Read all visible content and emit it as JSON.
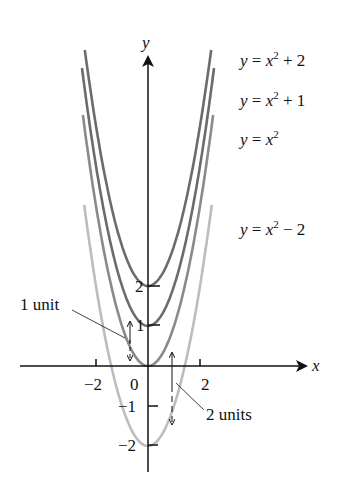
{
  "chart_data": {
    "type": "line",
    "title": "",
    "xlabel": "x",
    "ylabel": "y",
    "x_ticks": [
      "−2",
      "0",
      "2"
    ],
    "y_ticks": [
      "2",
      "1",
      "−1",
      "−2"
    ],
    "series": [
      {
        "name": "y = x² + 2",
        "shift": 2,
        "color": "#6b6b6b"
      },
      {
        "name": "y = x² + 1",
        "shift": 1,
        "color": "#6b6b6b"
      },
      {
        "name": "y = x²",
        "shift": 0,
        "color": "#8a8a8a"
      },
      {
        "name": "y = x² − 2",
        "shift": -2,
        "color": "#bdbdbd"
      }
    ],
    "annotations": [
      "1 unit",
      "2 units"
    ]
  },
  "labels": {
    "eq1_a": "y",
    "eq1_b": " = ",
    "eq1_c": "x",
    "eq1_sup": "2",
    "eq1_d": " + 2",
    "eq2_a": "y",
    "eq2_b": " = ",
    "eq2_c": "x",
    "eq2_sup": "2",
    "eq2_d": " + 1",
    "eq3_a": "y",
    "eq3_b": " = ",
    "eq3_c": "x",
    "eq3_sup": "2",
    "eq4_a": "y",
    "eq4_b": " = ",
    "eq4_c": "x",
    "eq4_sup": "2",
    "eq4_d": " − 2",
    "x_axis": "x",
    "y_axis": "y",
    "tick_xm2": "−2",
    "tick_x0": "0",
    "tick_x2": "2",
    "tick_y2": "2",
    "tick_y1": "1",
    "tick_ym1": "−1",
    "tick_ym2": "−2",
    "one_unit": "1 unit",
    "two_units": "2 units"
  }
}
